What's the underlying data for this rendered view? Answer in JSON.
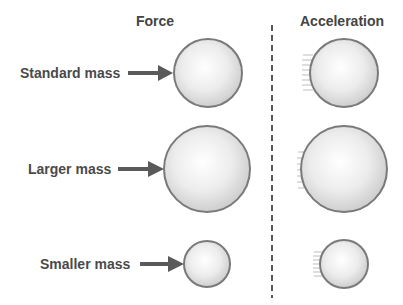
{
  "columns": {
    "force": "Force",
    "acceleration": "Acceleration"
  },
  "rows": [
    {
      "label": "Standard mass",
      "mass": "standard",
      "relative_size": 1.0,
      "acceleration_streak": "medium"
    },
    {
      "label": "Larger mass",
      "mass": "larger",
      "relative_size": 1.27,
      "acceleration_streak": "short"
    },
    {
      "label": "Smaller mass",
      "mass": "smaller",
      "relative_size": 0.69,
      "acceleration_streak": "long"
    }
  ],
  "colors": {
    "text": "#444444",
    "arrow": "#5a5a5a",
    "circle_stroke": "#7a7a7a",
    "circle_fill_light": "#ffffff",
    "circle_fill_dark": "#cfcfcf",
    "divider": "#555555"
  }
}
